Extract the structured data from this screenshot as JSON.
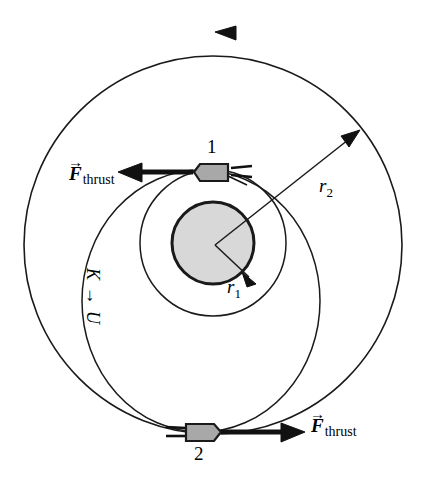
{
  "figure": {
    "background_color": "#ffffff",
    "stroke_color": "#1a1a1a",
    "planet_fill": "#d8d8d8",
    "craft_fill": "#a8a8a8"
  },
  "labels": {
    "craft1_number": "1",
    "craft2_number": "2",
    "thrust_top": {
      "symbol": "F",
      "vector_arrow": "→",
      "subscript": "thrust"
    },
    "thrust_bottom": {
      "symbol": "F",
      "vector_arrow": "→",
      "subscript": "thrust"
    },
    "radius_inner": {
      "symbol": "r",
      "subscript": "1"
    },
    "radius_outer": {
      "symbol": "r",
      "subscript": "2"
    },
    "energy_transfer": {
      "from": "K",
      "arrow": "→",
      "to": "U",
      "full": "K → U"
    }
  },
  "geometry": {
    "planet": {
      "cx": 213,
      "cy": 243,
      "r": 41
    },
    "inner_orbit": {
      "cx": 213,
      "cy": 243,
      "r": 73
    },
    "outer_orbit": {
      "cx": 213,
      "cy": 245,
      "r": 189
    },
    "transfer_ellipse": {
      "cx": 200,
      "cy": 300,
      "rx": 118,
      "ry": 133
    },
    "orbit_direction": "counterclockwise",
    "craft1": {
      "x": 213,
      "y": 172
    },
    "craft2": {
      "x": 200,
      "y": 432
    }
  }
}
